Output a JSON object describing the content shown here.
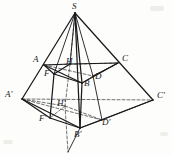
{
  "figure": {
    "kind": "geometry-diagram",
    "canvas": {
      "width": 172,
      "height": 155
    },
    "colors": {
      "background": "#fdfdfb",
      "stroke_solid": "#1a1a1c",
      "stroke_dashed": "#4a4a4e",
      "label_text": "#18181a"
    },
    "stroke_widths": {
      "solid": 1.25,
      "thin": 0.9,
      "dashed": 0.8
    },
    "dash_pattern": "3,2",
    "points": {
      "S": {
        "x": 75,
        "y": 13,
        "label": "S",
        "lx": 72,
        "ly": 3,
        "style": "solid"
      },
      "A": {
        "x": 44,
        "y": 65,
        "label": "A",
        "lx": 34,
        "ly": 56,
        "style": "solid"
      },
      "C": {
        "x": 118,
        "y": 63,
        "label": "C",
        "lx": 122,
        "ly": 55,
        "style": "solid"
      },
      "B": {
        "x": 82,
        "y": 83,
        "label": "B",
        "lx": 84,
        "ly": 82,
        "style": "solid"
      },
      "D": {
        "x": 93,
        "y": 76,
        "label": "D",
        "lx": 95,
        "ly": 73,
        "style": "dashed"
      },
      "H": {
        "x": 70,
        "y": 64,
        "label": "H",
        "lx": 67,
        "ly": 56,
        "style": "solid"
      },
      "F": {
        "x": 54,
        "y": 74,
        "label": "F",
        "lx": 45,
        "ly": 70,
        "style": "solid"
      },
      "Ap": {
        "x": 22,
        "y": 99,
        "label": "A'",
        "lx": 7,
        "ly": 91,
        "style": "solid"
      },
      "Cp": {
        "x": 153,
        "y": 100,
        "label": "C'",
        "lx": 157,
        "ly": 92,
        "style": "solid"
      },
      "Bp": {
        "x": 80,
        "y": 128,
        "label": "B'",
        "lx": 76,
        "ly": 131,
        "style": "solid"
      },
      "Dp": {
        "x": 102,
        "y": 120,
        "label": "D'",
        "lx": 104,
        "ly": 120,
        "style": "dashed"
      },
      "Hp": {
        "x": 65,
        "y": 106,
        "label": "H'",
        "lx": 58,
        "ly": 98,
        "style": "dashed"
      },
      "Fp": {
        "x": 50,
        "y": 118,
        "label": "F'",
        "lx": 41,
        "ly": 117,
        "style": "solid"
      },
      "T": {
        "x": 68,
        "y": 152,
        "label": "",
        "lx": 0,
        "ly": 0,
        "style": "solid"
      }
    },
    "solid_edges": [
      {
        "name": "edge-S-Ap",
        "from": "S",
        "to": "Ap"
      },
      {
        "name": "edge-S-Cp",
        "from": "S",
        "to": "Cp"
      },
      {
        "name": "edge-S-Bp",
        "from": "S",
        "to": "Bp"
      },
      {
        "name": "edge-Ap-Bp",
        "from": "Ap",
        "to": "Bp"
      },
      {
        "name": "edge-Bp-Cp",
        "from": "Bp",
        "to": "Cp"
      },
      {
        "name": "edge-A-B",
        "from": "A",
        "to": "B"
      },
      {
        "name": "edge-B-C",
        "from": "B",
        "to": "C"
      },
      {
        "name": "edge-A-C-upper-left",
        "from": "A",
        "to": "H"
      },
      {
        "name": "edge-H-C",
        "from": "H",
        "to": "C"
      },
      {
        "name": "edge-F-H",
        "from": "F",
        "to": "H"
      },
      {
        "name": "edge-F-B",
        "from": "F",
        "to": "B"
      },
      {
        "name": "edge-A-F-vert",
        "from": "A",
        "to": "F"
      },
      {
        "name": "edge-F-Fp-vert",
        "from": "F",
        "to": "Fp"
      },
      {
        "name": "edge-Fp-Bp",
        "from": "Fp",
        "to": "Bp"
      },
      {
        "name": "edge-Ap-Fp",
        "from": "Ap",
        "to": "Fp"
      },
      {
        "name": "edge-B-Bp-vert",
        "from": "B",
        "to": "Bp"
      },
      {
        "name": "edge-Bp-T",
        "from": "Bp",
        "to": "T"
      },
      {
        "name": "edge-S-H-seg",
        "from": "S",
        "to": "H"
      },
      {
        "name": "edge-S-F-seg",
        "from": "S",
        "to": "F"
      },
      {
        "name": "edge-S-B-seg",
        "from": "S",
        "to": "B"
      },
      {
        "name": "edge-S-D-seg",
        "from": "S",
        "to": "D"
      },
      {
        "name": "edge-Cp-Dp",
        "from": "Cp",
        "to": "Dp"
      },
      {
        "name": "edge-Dp-Bp",
        "from": "Dp",
        "to": "Bp"
      },
      {
        "name": "edge-C-D",
        "from": "C",
        "to": "D"
      },
      {
        "name": "edge-D-Dp-vert",
        "from": "D",
        "to": "Dp"
      }
    ],
    "dashed_edges": [
      {
        "name": "dash-A-C",
        "from": "A",
        "to": "C"
      },
      {
        "name": "dash-A-D",
        "from": "A",
        "to": "D"
      },
      {
        "name": "dash-D-C",
        "from": "D",
        "to": "C"
      },
      {
        "name": "dash-Ap-Cp",
        "from": "Ap",
        "to": "Cp"
      },
      {
        "name": "dash-Ap-Dp",
        "from": "Ap",
        "to": "Dp"
      },
      {
        "name": "dash-H-Hp",
        "from": "H",
        "to": "Hp"
      },
      {
        "name": "dash-S-H-axis",
        "from": "S",
        "to": "H"
      },
      {
        "name": "dash-Hp-T-axis",
        "from": "Hp",
        "to": "T"
      },
      {
        "name": "dash-Hp-Dp",
        "from": "Hp",
        "to": "Dp"
      },
      {
        "name": "dash-Hp-Fp",
        "from": "Hp",
        "to": "Fp"
      },
      {
        "name": "dash-Hp-Ap",
        "from": "Hp",
        "to": "Ap"
      },
      {
        "name": "dash-D-B",
        "from": "D",
        "to": "B"
      }
    ],
    "labels": [
      {
        "name": "label-S",
        "text": "S",
        "x": 72,
        "y": 2
      },
      {
        "name": "label-A",
        "text": "A",
        "x": 33,
        "y": 55
      },
      {
        "name": "label-C",
        "text": "C",
        "x": 122,
        "y": 54
      },
      {
        "name": "label-H",
        "text": "H",
        "x": 66,
        "y": 57
      },
      {
        "name": "label-F",
        "text": "F",
        "x": 44,
        "y": 69
      },
      {
        "name": "label-D",
        "text": "D",
        "x": 95,
        "y": 72
      },
      {
        "name": "label-B",
        "text": "B",
        "x": 84,
        "y": 79
      },
      {
        "name": "label-Ap",
        "text": "A'",
        "x": 5,
        "y": 90
      },
      {
        "name": "label-Cp",
        "text": "C'",
        "x": 157,
        "y": 91
      },
      {
        "name": "label-Hp",
        "text": "H'",
        "x": 57,
        "y": 99
      },
      {
        "name": "label-Fp",
        "text": "F'",
        "x": 39,
        "y": 114
      },
      {
        "name": "label-Dp",
        "text": "D'",
        "x": 102,
        "y": 118
      },
      {
        "name": "label-Bp",
        "text": "B'",
        "x": 74,
        "y": 130
      }
    ]
  }
}
